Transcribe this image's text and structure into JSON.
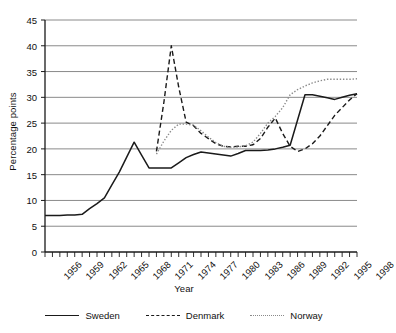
{
  "chart_data": {
    "type": "line",
    "title": "",
    "xlabel": "Year",
    "ylabel": "Percentage points",
    "xlim": [
      1956,
      1998
    ],
    "ylim": [
      0,
      45
    ],
    "ytick_step": 5,
    "yticks": [
      0,
      5,
      10,
      15,
      20,
      25,
      30,
      35,
      40,
      45
    ],
    "xticks": [
      1956,
      1959,
      1962,
      1965,
      1968,
      1971,
      1974,
      1977,
      1980,
      1983,
      1986,
      1989,
      1992,
      1995,
      1998
    ],
    "xtick_labels": [
      "1956",
      "1959",
      "1962",
      "1965",
      "1968",
      "1971",
      "1974",
      "1977",
      "1980",
      "1983",
      "1986",
      "1989",
      "1992",
      "1995",
      "1998"
    ],
    "xtick_minor_every": 1,
    "grid": "horizontal",
    "legend_position": "bottom",
    "series": [
      {
        "name": "Sweden",
        "style": "solid",
        "color": "#1a1a1a",
        "x": [
          1956,
          1957,
          1958,
          1959,
          1960,
          1961,
          1962,
          1963,
          1964,
          1965,
          1966,
          1967,
          1968,
          1969,
          1970,
          1971,
          1972,
          1973,
          1974,
          1975,
          1976,
          1977,
          1978,
          1979,
          1980,
          1981,
          1982,
          1983,
          1984,
          1985,
          1986,
          1987,
          1988,
          1989,
          1990,
          1991,
          1992,
          1993,
          1994,
          1995,
          1996,
          1997,
          1998
        ],
        "values": [
          7.1,
          7.1,
          7.1,
          7.2,
          7.2,
          7.3,
          8.4,
          9.4,
          10.5,
          13.0,
          15.5,
          18.4,
          21.3,
          18.8,
          16.3,
          16.3,
          16.3,
          16.3,
          17.3,
          18.3,
          18.9,
          19.4,
          19.2,
          19.0,
          18.8,
          18.6,
          19.1,
          19.7,
          19.7,
          19.7,
          19.8,
          20.0,
          20.3,
          20.7,
          25.6,
          30.5,
          30.5,
          30.2,
          29.9,
          29.6,
          30.0,
          30.4,
          30.7
        ]
      },
      {
        "name": "Denmark",
        "style": "dashed",
        "color": "#1a1a1a",
        "x": [
          1971,
          1972,
          1973,
          1974,
          1975,
          1976,
          1977,
          1978,
          1979,
          1980,
          1981,
          1982,
          1983,
          1984,
          1985,
          1986,
          1987,
          1988,
          1989,
          1990,
          1991,
          1992,
          1993,
          1994,
          1995,
          1996,
          1997,
          1998
        ],
        "values": [
          19.5,
          29.0,
          40.0,
          32.0,
          25.2,
          24.5,
          23.0,
          22.0,
          21.0,
          20.5,
          20.4,
          20.5,
          20.5,
          20.8,
          22.0,
          24.2,
          26.0,
          23.0,
          20.5,
          19.5,
          20.0,
          21.0,
          22.5,
          24.5,
          26.5,
          28.0,
          29.5,
          30.7
        ]
      },
      {
        "name": "Norway",
        "style": "dotted",
        "color": "#8a8a8a",
        "x": [
          1971,
          1972,
          1973,
          1974,
          1975,
          1976,
          1977,
          1978,
          1979,
          1980,
          1981,
          1982,
          1983,
          1984,
          1985,
          1986,
          1987,
          1988,
          1989,
          1990,
          1991,
          1992,
          1993,
          1994,
          1995,
          1996,
          1997,
          1998
        ],
        "values": [
          19.0,
          21.5,
          23.6,
          24.8,
          24.8,
          24.6,
          23.5,
          22.3,
          21.2,
          20.5,
          20.3,
          20.4,
          20.6,
          21.3,
          23.0,
          25.0,
          26.3,
          28.0,
          30.5,
          31.5,
          32.2,
          32.8,
          33.2,
          33.5,
          33.5,
          33.5,
          33.5,
          33.6
        ]
      }
    ]
  },
  "legend": {
    "items": [
      {
        "label": "Sweden"
      },
      {
        "label": "Denmark"
      },
      {
        "label": "Norway"
      }
    ]
  },
  "axes": {
    "x_title": "Year",
    "y_title": "Percentage points"
  }
}
